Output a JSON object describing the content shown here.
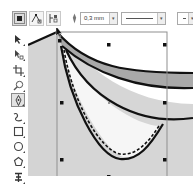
{
  "property_bar": {
    "buttons": [
      {
        "name": "select-all-nodes",
        "active": true
      },
      {
        "name": "reduce-nodes",
        "active": false
      },
      {
        "name": "elastic-mode",
        "active": false
      }
    ],
    "outline_width": {
      "value": "0,3 mm"
    },
    "line_style": {
      "value": "solid"
    },
    "arrowhead": {
      "value": "none"
    }
  },
  "toolbox": {
    "tools": [
      {
        "name": "pick-tool"
      },
      {
        "name": "shape-tool"
      },
      {
        "name": "crop-tool"
      },
      {
        "name": "zoom-tool"
      },
      {
        "name": "freehand-tool",
        "active": true
      },
      {
        "name": "smart-fill-tool"
      },
      {
        "name": "rectangle-tool"
      },
      {
        "name": "ellipse-tool"
      },
      {
        "name": "polygon-tool"
      },
      {
        "name": "text-tool"
      }
    ]
  },
  "canvas": {
    "colors": {
      "page_fill": "#d3d3d3",
      "band_fill": "#a9a9a9",
      "inner_fill": "#f5f5f5",
      "stroke": "#111111",
      "selection_box": "#8f8f8f"
    }
  }
}
